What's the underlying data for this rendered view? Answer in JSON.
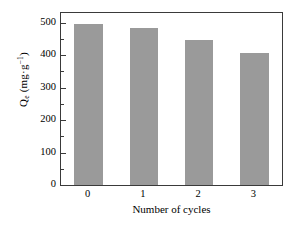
{
  "chart_data": {
    "type": "bar",
    "title": "",
    "categories": [
      "0",
      "1",
      "2",
      "3"
    ],
    "values": [
      495,
      485,
      447,
      408
    ],
    "xlabel": "Number of cycles",
    "ylabel_text": "Q",
    "ylabel_sub": "e",
    "ylabel_units": " (mg·g",
    "ylabel_sup": "−1",
    "ylabel_close": ")",
    "ylabel_full": "Qe (mg·g⁻¹)",
    "ylim": [
      0,
      530
    ],
    "xlim": [
      -0.5,
      3.5
    ],
    "yticks": [
      0,
      100,
      200,
      300,
      400,
      500
    ],
    "ytick_labels": [
      "0",
      "100",
      "200",
      "300",
      "400",
      "500"
    ],
    "yminorticks": [
      50,
      150,
      250,
      350,
      450
    ],
    "xticks": [
      0,
      1,
      2,
      3
    ],
    "xtick_labels": [
      "0",
      "1",
      "2",
      "3"
    ],
    "grid": false,
    "legend": false,
    "bar_color": "#9a9a9a",
    "axis_color": "#3a3a3a",
    "background_color": "#ffffff",
    "bar_width_fraction": 0.52
  }
}
